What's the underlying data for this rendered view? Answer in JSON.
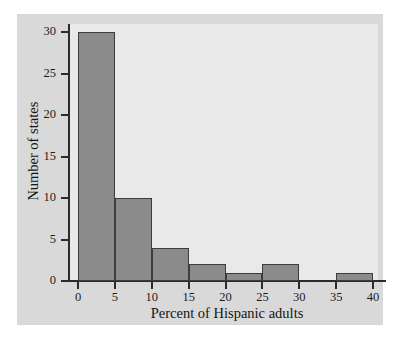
{
  "chart_data": {
    "type": "bar",
    "title": "",
    "subtitle": "",
    "xlabel": "Percent of Hispanic adults",
    "ylabel": "Number of states",
    "categories": [
      "0-5",
      "5-10",
      "10-15",
      "15-20",
      "20-25",
      "25-30",
      "30-35",
      "35-40"
    ],
    "bin_edges": [
      0,
      5,
      10,
      15,
      20,
      25,
      30,
      35,
      40
    ],
    "values": [
      30,
      10,
      4,
      2,
      1,
      2,
      0,
      1
    ],
    "bins": [
      {
        "start": 0,
        "end": 5,
        "count": 30
      },
      {
        "start": 5,
        "end": 10,
        "count": 10
      },
      {
        "start": 10,
        "end": 15,
        "count": 4
      },
      {
        "start": 15,
        "end": 20,
        "count": 2
      },
      {
        "start": 20,
        "end": 25,
        "count": 1
      },
      {
        "start": 25,
        "end": 30,
        "count": 2
      },
      {
        "start": 30,
        "end": 35,
        "count": 0
      },
      {
        "start": 35,
        "end": 40,
        "count": 1
      }
    ],
    "xlim": [
      0,
      40
    ],
    "ylim": [
      0,
      30
    ],
    "xticks": [
      0,
      5,
      10,
      15,
      20,
      25,
      30,
      35,
      40
    ],
    "yticks": [
      0,
      5,
      10,
      15,
      20,
      25,
      30
    ],
    "xtick_labels": [
      "0",
      "5",
      "10",
      "15",
      "20",
      "25",
      "30",
      "35",
      "40"
    ],
    "ytick_labels": [
      "0",
      "5",
      "10",
      "15",
      "20",
      "25",
      "30"
    ],
    "grid": false,
    "legend": null,
    "annotations": [],
    "colors": {
      "bar_fill": "#8b8b8b",
      "bar_edge": "#3d3d3d",
      "plot_background": "#e9e9e9",
      "figure_background": "#d9d9d9",
      "page_background": "#ffffff",
      "axis": "#2b2b2b",
      "text": "#151515"
    }
  }
}
